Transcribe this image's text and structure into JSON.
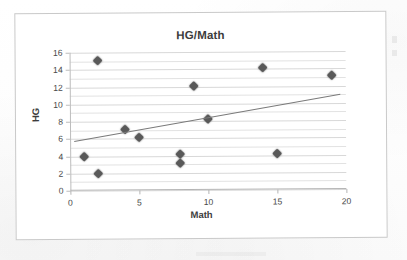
{
  "chart_data": {
    "type": "scatter",
    "title": "HG/Math",
    "xlabel": "Math",
    "ylabel": "HG",
    "xlim": [
      0,
      20
    ],
    "ylim": [
      0,
      16
    ],
    "xticks": [
      "0",
      "5",
      "10",
      "15",
      "20"
    ],
    "yticks": [
      "0",
      "2",
      "4",
      "6",
      "8",
      "10",
      "12",
      "14",
      "16"
    ],
    "x_major_step": 5,
    "y_major_step": 2,
    "y_minor_step": 1,
    "grid": "horizontal-major-and-minor",
    "legend": "none",
    "marker_shape": "diamond",
    "marker_color": "#595959",
    "points": [
      {
        "x": 1,
        "y": 4.0
      },
      {
        "x": 2,
        "y": 15.1
      },
      {
        "x": 2,
        "y": 2.0
      },
      {
        "x": 4,
        "y": 7.1
      },
      {
        "x": 5,
        "y": 6.1
      },
      {
        "x": 8,
        "y": 4.2
      },
      {
        "x": 8,
        "y": 3.1
      },
      {
        "x": 9,
        "y": 12.1
      },
      {
        "x": 10,
        "y": 8.2
      },
      {
        "x": 14,
        "y": 14.2
      },
      {
        "x": 15,
        "y": 4.2
      },
      {
        "x": 19,
        "y": 13.2
      }
    ],
    "trendline": {
      "type": "linear",
      "color": "#7a7a7a",
      "x_start": 0.3,
      "y_start": 5.7,
      "x_end": 19.6,
      "y_end": 11.0
    }
  }
}
